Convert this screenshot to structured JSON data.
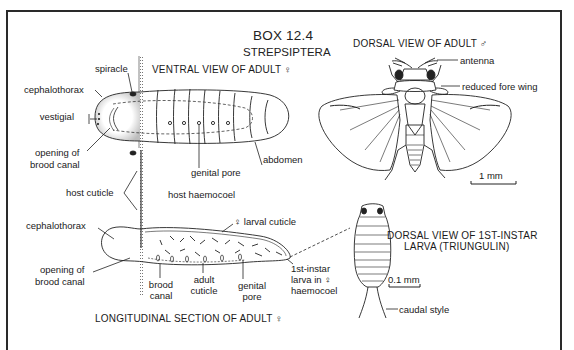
{
  "box": {
    "number": "BOX 12.4",
    "subject": "STREPSIPTERA"
  },
  "panels": {
    "ventral_female": {
      "heading": "VENTRAL VIEW OF ADULT ♀",
      "labels": {
        "spiracle": "spiracle",
        "cephalothorax": "cephalothorax",
        "vestigial_1": "vestigial",
        "vestigial_2": "mouthparts",
        "opening_1": "opening of",
        "opening_2": "brood canal",
        "genital_pore": "genital pore",
        "abdomen": "abdomen"
      }
    },
    "host": {
      "cuticle": "host cuticle",
      "haemocoel": "host haemocoel"
    },
    "dorsal_male": {
      "heading": "DORSAL VIEW OF ADULT ♂",
      "labels": {
        "antenna": "antenna",
        "fore_wing": "reduced fore wing"
      },
      "scale": "1 mm"
    },
    "longitudinal_section": {
      "heading": "LONGITUDINAL SECTION OF ADULT ♀",
      "labels": {
        "cephalothorax": "cephalothorax",
        "larval_cuticle": "♀ larval cuticle",
        "opening_1": "opening of",
        "opening_2": "brood canal",
        "brood_1": "brood",
        "brood_2": "canal",
        "adult_1": "adult",
        "adult_2": "cuticle",
        "genital_1": "genital",
        "genital_2": "pore",
        "larva_1": "1st-instar",
        "larva_2": "larva in ♀",
        "larva_3": "haemocoel"
      }
    },
    "triungulin": {
      "heading_1": "DORSAL VIEW OF 1ST-INSTAR",
      "heading_2": "LARVA (TRIUNGULIN)",
      "scale": "0.1 mm",
      "caudal": "caudal style"
    }
  }
}
